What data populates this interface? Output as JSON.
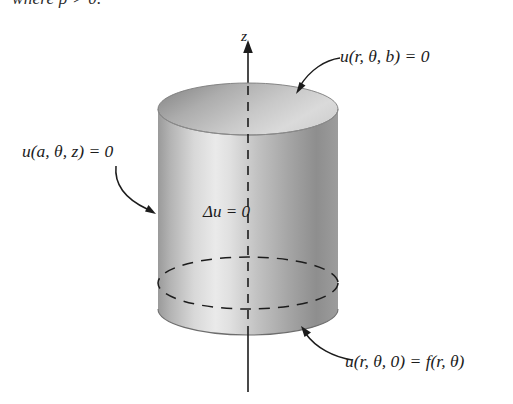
{
  "figure": {
    "cutoff_line": "where ρ > 0.",
    "axis_label": "z",
    "interior_equation": "Δu = 0",
    "labels": {
      "top": "u(r, θ, b) = 0",
      "side": "u(a, θ, z) = 0",
      "bottom": "u(r, θ, 0) = f(r, θ)"
    },
    "annotations": [
      {
        "name": "top-boundary-condition",
        "text": "u(r, θ, b) = 0",
        "points_to": "cylinder-top-face"
      },
      {
        "name": "lateral-boundary-condition",
        "text": "u(a, θ, z) = 0",
        "points_to": "cylinder-lateral-surface"
      },
      {
        "name": "bottom-boundary-condition",
        "text": "u(r, θ, 0) = f(r, θ)",
        "points_to": "cylinder-bottom-face"
      }
    ],
    "colors": {
      "ink": "#1c1c1c",
      "background": "#ffffff",
      "surface_dark": "#6f6f6f",
      "surface_mid": "#a8a8a8",
      "surface_light": "#e6e6e6",
      "outline": "#3a3a3a"
    },
    "geometry": {
      "axis_x": 248,
      "top_ellipse_center_y": 109,
      "bottom_ellipse_center_y": 309,
      "radius_x": 90,
      "radius_y": 26
    }
  }
}
